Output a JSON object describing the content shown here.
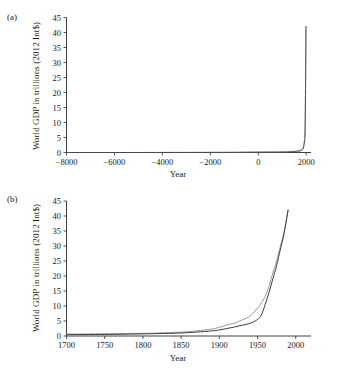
{
  "figure": {
    "panels": [
      {
        "key": "a",
        "label": "(a)",
        "xlabel": "Year",
        "ylabel": "World GDP in trillions (2012 Int$)",
        "xticks": [
          "-8000",
          "-6000",
          "-4000",
          "-2000",
          "0",
          "2000"
        ],
        "yticks": [
          "0",
          "5",
          "10",
          "15",
          "20",
          "25",
          "30",
          "35",
          "40",
          "45"
        ]
      },
      {
        "key": "b",
        "label": "(b)",
        "xlabel": "Year",
        "ylabel": "World GDP in trillions (2012 Int$)",
        "xticks": [
          "1700",
          "1750",
          "1800",
          "1850",
          "1900",
          "1950",
          "2000"
        ],
        "yticks": [
          "0",
          "5",
          "10",
          "15",
          "20",
          "25",
          "30",
          "35",
          "40",
          "45"
        ]
      }
    ]
  },
  "chart_data": [
    {
      "type": "line",
      "panel": "(a)",
      "title": "",
      "xlabel": "Year",
      "ylabel": "World GDP in trillions (2012 Int$)",
      "xlim": [
        -8000,
        2200
      ],
      "ylim": [
        0,
        45
      ],
      "xticks": [
        -8000,
        -6000,
        -4000,
        -2000,
        0,
        2000
      ],
      "yticks": [
        0,
        5,
        10,
        15,
        20,
        25,
        30,
        35,
        40,
        45
      ],
      "grid": false,
      "legend": "none",
      "series": [
        {
          "name": "series-light",
          "color": "#9a9a9a",
          "x": [
            -8000,
            -7000,
            -6000,
            -5000,
            -4000,
            -3000,
            -2000,
            -1000,
            0,
            500,
            1000,
            1300,
            1500,
            1600,
            1700,
            1800,
            1850,
            1900,
            1920,
            1940,
            1950,
            1960,
            1970,
            1980,
            1990
          ],
          "y": [
            0.0,
            0.0,
            0.0,
            0.01,
            0.02,
            0.03,
            0.05,
            0.08,
            0.18,
            0.2,
            0.21,
            0.29,
            0.43,
            0.58,
            0.64,
            0.89,
            1.21,
            2.7,
            4.0,
            6.2,
            9.3,
            14.0,
            21.0,
            30.0,
            42.0
          ]
        },
        {
          "name": "series-dark",
          "color": "#3c3c3c",
          "x": [
            -8000,
            -7000,
            -6000,
            -5000,
            -4000,
            -3000,
            -2000,
            -1000,
            0,
            500,
            1000,
            1300,
            1500,
            1600,
            1700,
            1800,
            1850,
            1900,
            1920,
            1940,
            1950,
            1960,
            1970,
            1980,
            1990
          ],
          "y": [
            0.0,
            0.0,
            0.0,
            0.0,
            0.01,
            0.02,
            0.03,
            0.05,
            0.1,
            0.12,
            0.14,
            0.2,
            0.3,
            0.38,
            0.45,
            0.7,
            1.0,
            2.0,
            3.0,
            4.2,
            5.5,
            10.5,
            19.0,
            29.0,
            42.0
          ]
        }
      ]
    },
    {
      "type": "line",
      "panel": "(b)",
      "title": "",
      "xlabel": "Year",
      "ylabel": "World GDP in trillions (2012 Int$)",
      "xlim": [
        1700,
        2020
      ],
      "ylim": [
        0,
        45
      ],
      "xticks": [
        1700,
        1750,
        1800,
        1850,
        1900,
        1950,
        2000
      ],
      "yticks": [
        0,
        5,
        10,
        15,
        20,
        25,
        30,
        35,
        40,
        45
      ],
      "grid": false,
      "legend": "none",
      "series": [
        {
          "name": "series-light",
          "color": "#9a9a9a",
          "x": [
            1700,
            1750,
            1800,
            1820,
            1850,
            1870,
            1890,
            1900,
            1910,
            1920,
            1930,
            1940,
            1950,
            1955,
            1960,
            1965,
            1970,
            1975,
            1980,
            1985,
            1990
          ],
          "y": [
            0.64,
            0.73,
            0.89,
            0.99,
            1.3,
            1.7,
            2.3,
            2.9,
            3.7,
            4.3,
            5.4,
            6.6,
            9.3,
            11.0,
            13.2,
            16.5,
            21.0,
            25.0,
            30.0,
            35.0,
            42.0
          ]
        },
        {
          "name": "series-dark",
          "color": "#3c3c3c",
          "x": [
            1700,
            1750,
            1800,
            1820,
            1850,
            1870,
            1890,
            1900,
            1910,
            1920,
            1930,
            1940,
            1950,
            1955,
            1960,
            1965,
            1970,
            1975,
            1980,
            1985,
            1990
          ],
          "y": [
            0.45,
            0.52,
            0.7,
            0.8,
            1.0,
            1.3,
            1.7,
            2.0,
            2.5,
            3.0,
            3.6,
            4.2,
            5.5,
            7.0,
            10.5,
            14.5,
            19.0,
            23.5,
            29.0,
            34.5,
            42.0
          ]
        }
      ]
    }
  ]
}
